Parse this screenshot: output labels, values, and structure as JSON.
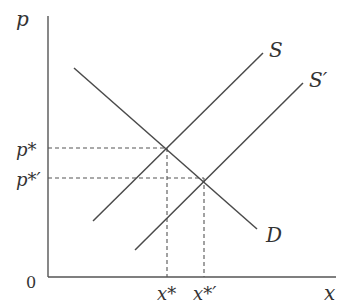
{
  "diagram": {
    "colors": {
      "line": "#4a4a4a",
      "axis": "#555555",
      "text": "#333333",
      "dash": "#555555"
    },
    "axes": {
      "y_label": "p",
      "x_label": "x",
      "origin_label": "0"
    },
    "curves": {
      "demand": {
        "label": "D"
      },
      "supply": {
        "label": "S"
      },
      "supply_shifted": {
        "label": "S′"
      }
    },
    "equilibria": {
      "original": {
        "price_label": "p*",
        "quantity_label": "x*"
      },
      "shifted": {
        "price_label": "p*′",
        "quantity_label": "x*′"
      }
    }
  }
}
